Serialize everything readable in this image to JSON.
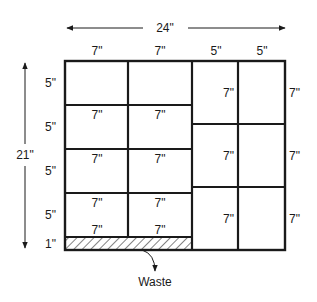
{
  "diagram": {
    "overall_width_label": "24\"",
    "overall_height_label": "21\"",
    "column_widths": [
      "7\"",
      "7\"",
      "5\"",
      "5\""
    ],
    "row_heights": [
      "5\"",
      "5\"",
      "5\"",
      "5\"",
      "1\""
    ],
    "left_section": {
      "pieces": [
        {
          "row": 1,
          "col": 1,
          "label": ""
        },
        {
          "row": 1,
          "col": 2,
          "label": ""
        },
        {
          "row": 2,
          "col": 1,
          "label": "7\""
        },
        {
          "row": 2,
          "col": 2,
          "label": "7\""
        },
        {
          "row": 3,
          "col": 1,
          "label": "7\""
        },
        {
          "row": 3,
          "col": 2,
          "label": "7\""
        },
        {
          "row": 4,
          "col": 1,
          "label": "7\""
        },
        {
          "row": 4,
          "col": 2,
          "label": "7\""
        }
      ],
      "row4_bottom_labels": [
        "7\"",
        "7\""
      ]
    },
    "right_section": {
      "piece_height_labels": [
        "7\"",
        "7\"",
        "7\""
      ],
      "outer_height_labels": [
        "7\"",
        "7\"",
        "7\""
      ]
    },
    "waste": {
      "label": "Waste",
      "pattern": "diagonal-hatch"
    },
    "colors": {
      "line": "#1a1a1a",
      "background": "#ffffff"
    }
  }
}
